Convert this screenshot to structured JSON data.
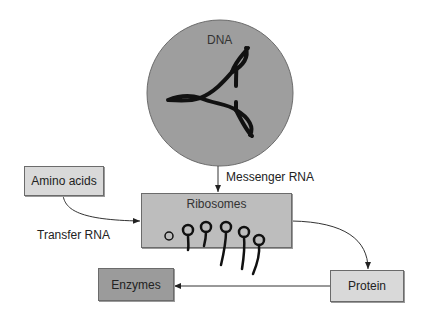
{
  "diagram": {
    "nodes": {
      "dna": {
        "label": "DNA",
        "shape": "circle",
        "fill": "#999999"
      },
      "amino_acids": {
        "label": "Amino acids",
        "fill": "#d9d9d9"
      },
      "ribosomes": {
        "label": "Ribosomes",
        "fill": "#bdbdbd"
      },
      "protein": {
        "label": "Protein",
        "fill": "#d9d9d9"
      },
      "enzymes": {
        "label": "Enzymes",
        "fill": "#9b9b9b"
      }
    },
    "edges": {
      "messenger_rna": {
        "from": "DNA",
        "to": "Ribosomes",
        "label": "Messenger RNA"
      },
      "transfer_rna": {
        "from": "Amino acids",
        "to": "Ribosomes",
        "label": "Transfer RNA"
      },
      "ribo_to_protein": {
        "from": "Ribosomes",
        "to": "Protein"
      },
      "protein_to_enzymes": {
        "from": "Protein",
        "to": "Enzymes"
      }
    }
  }
}
